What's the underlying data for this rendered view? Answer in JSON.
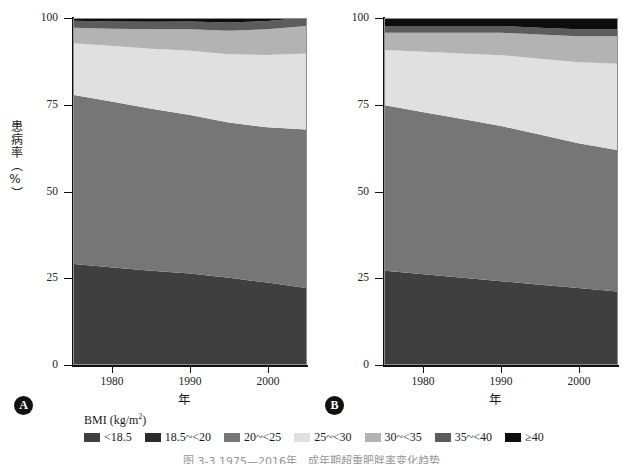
{
  "figure": {
    "caption": "图 3-3  1975—2016年　成年期超重肥胖率变化趋势",
    "panels": [
      {
        "badge": "A",
        "x_title": "年",
        "y_title": "患病率（%）"
      },
      {
        "badge": "B",
        "x_title": "年",
        "y_title": "患病率（%）"
      }
    ]
  },
  "legend": {
    "title_main": "BMI (kg/m",
    "title_sup": "2",
    "title_tail": ")",
    "items": [
      {
        "label": "<18.5",
        "color": "#3f3f3f"
      },
      {
        "label": "18.5~<20",
        "color": "#2b2b2b"
      },
      {
        "label": "20~<25",
        "color": "#767676"
      },
      {
        "label": "25~<30",
        "color": "#e0e0e0"
      },
      {
        "label": "30~<35",
        "color": "#b3b3b3"
      },
      {
        "label": "35~<40",
        "color": "#5c5c5c"
      },
      {
        "label": "≥40",
        "color": "#0d0d0d"
      }
    ]
  },
  "axes": {
    "y_ticks": [
      "0",
      "25",
      "50",
      "75",
      "100"
    ],
    "y_tick_values": [
      0,
      25,
      50,
      75,
      100
    ],
    "x_ticks": [
      "1980",
      "1990",
      "2000"
    ],
    "x_tick_values": [
      1980,
      1990,
      2000
    ]
  },
  "chart_data": {
    "type": "area",
    "xlabel": "年",
    "ylabel": "患病率（%）",
    "xlim": [
      1975,
      2005
    ],
    "ylim": [
      0,
      100
    ],
    "grid": false,
    "legend_position": "bottom",
    "stacked": true,
    "stack_order": [
      "<18.5",
      "18.5~<20",
      "20~<25",
      "25~<30",
      "30~<35",
      "35~<40",
      "≥40"
    ],
    "panels": [
      {
        "name": "A",
        "x": [
          1975,
          1980,
          1985,
          1990,
          1995,
          2000,
          2005
        ],
        "series": [
          {
            "name": "<18.5",
            "color": "#3f3f3f",
            "values": [
              29.0,
              28.0,
              27.0,
              26.2,
              25.0,
              23.6,
              22.0
            ]
          },
          {
            "name": "18.5~<20",
            "color": "#2b2b2b",
            "values": [
              0.0,
              0.0,
              0.0,
              0.0,
              0.0,
              0.0,
              0.0
            ]
          },
          {
            "name": "20~<25",
            "color": "#767676",
            "values": [
              49.0,
              48.0,
              47.0,
              46.0,
              45.0,
              45.0,
              46.0
            ]
          },
          {
            "name": "25~<30",
            "color": "#e0e0e0",
            "values": [
              15.0,
              16.2,
              17.4,
              18.6,
              19.8,
              21.0,
              22.0
            ]
          },
          {
            "name": "30~<35",
            "color": "#b3b3b3",
            "values": [
              4.5,
              5.0,
              5.6,
              6.2,
              6.8,
              7.4,
              8.0
            ]
          },
          {
            "name": "35~<40",
            "color": "#5c5c5c",
            "values": [
              2.0,
              2.1,
              2.2,
              2.3,
              2.4,
              2.4,
              2.4
            ]
          },
          {
            "name": "≥40",
            "color": "#0d0d0d",
            "values": [
              0.5,
              0.7,
              0.8,
              0.7,
              1.0,
              0.6,
              0.6
            ]
          }
        ],
        "boundaries_start": [
          29.0,
          29.0,
          78.0,
          93.0,
          97.5,
          99.5,
          100.0
        ],
        "boundaries_end": [
          22.0,
          22.0,
          68.0,
          90.0,
          98.0,
          99.4,
          100.0
        ]
      },
      {
        "name": "B",
        "x": [
          1975,
          1980,
          1985,
          1990,
          1995,
          2000,
          2005
        ],
        "series": [
          {
            "name": "<18.5",
            "color": "#3f3f3f",
            "values": [
              27.0,
              26.0,
              25.0,
              24.0,
              23.0,
              22.0,
              21.0
            ]
          },
          {
            "name": "18.5~<20",
            "color": "#2b2b2b",
            "values": [
              0.0,
              0.0,
              0.0,
              0.0,
              0.0,
              0.0,
              0.0
            ]
          },
          {
            "name": "20~<25",
            "color": "#767676",
            "values": [
              48.0,
              47.0,
              46.0,
              45.0,
              43.5,
              42.0,
              41.0
            ]
          },
          {
            "name": "25~<30",
            "color": "#e0e0e0",
            "values": [
              16.0,
              17.5,
              19.0,
              20.5,
              22.0,
              23.5,
              25.0
            ]
          },
          {
            "name": "30~<35",
            "color": "#b3b3b3",
            "values": [
              5.0,
              5.5,
              6.0,
              6.5,
              7.0,
              7.5,
              8.0
            ]
          },
          {
            "name": "35~<40",
            "color": "#5c5c5c",
            "values": [
              2.0,
              2.0,
              2.0,
              2.0,
              2.0,
              2.0,
              2.0
            ]
          },
          {
            "name": "≥40",
            "color": "#0d0d0d",
            "values": [
              2.0,
              2.0,
              2.0,
              2.0,
              2.5,
              3.0,
              3.0
            ]
          }
        ],
        "boundaries_start": [
          27.0,
          27.0,
          75.0,
          91.0,
          96.0,
          98.0,
          100.0
        ],
        "boundaries_end": [
          21.0,
          21.0,
          62.0,
          87.0,
          95.0,
          97.0,
          100.0
        ]
      }
    ]
  }
}
